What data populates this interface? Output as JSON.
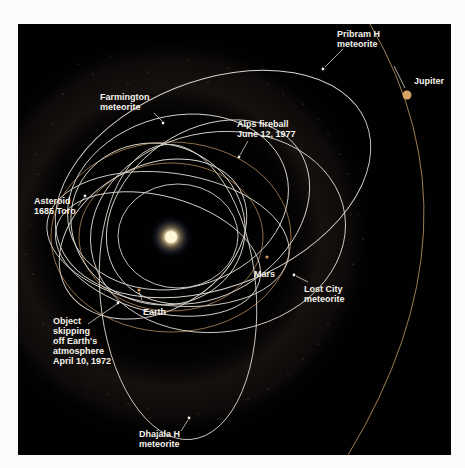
{
  "diagram": {
    "colors": {
      "background": "#020101",
      "page": "#fbfbfb",
      "orbit_line": "#d8d4cc",
      "planet_orbit": "#b08a5c",
      "jupiter": "#d6a566",
      "sun": "#fff4d0",
      "label": "#f4f1ea"
    },
    "center": {
      "name": "Sun"
    },
    "labels": {
      "jupiter": "Jupiter",
      "pribram": "Pribram H\nmeteorite",
      "farmington": "Farmington\nmeteorite",
      "alps": "Alps fireball\nJune 12, 1977",
      "toro": "Asteroid\n1685 Toro",
      "mars": "Mars",
      "earth": "Earth",
      "lost_city": "Lost City\nmeteorite",
      "grazer": "Object\nskipping\noff Earth's\natmosphere\nApril 10, 1972",
      "dhajala": "Dhajala H\nmeteorite"
    },
    "objects": [
      {
        "name": "Jupiter",
        "type": "planet"
      },
      {
        "name": "Mars",
        "type": "planet"
      },
      {
        "name": "Earth",
        "type": "planet"
      },
      {
        "name": "Pribram H meteorite",
        "type": "meteorite"
      },
      {
        "name": "Farmington meteorite",
        "type": "meteorite"
      },
      {
        "name": "Alps fireball June 12, 1977",
        "type": "fireball"
      },
      {
        "name": "Asteroid 1685 Toro",
        "type": "asteroid"
      },
      {
        "name": "Lost City meteorite",
        "type": "meteorite"
      },
      {
        "name": "Object skipping off Earth's atmosphere April 10, 1972",
        "type": "grazer"
      },
      {
        "name": "Dhajala H meteorite",
        "type": "meteorite"
      }
    ]
  }
}
